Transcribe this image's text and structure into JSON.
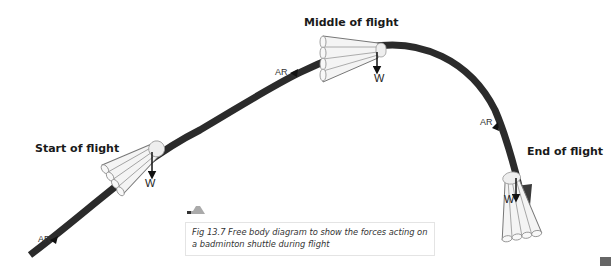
{
  "figure": {
    "stages": [
      {
        "label": "Start of flight",
        "weight_label": "W",
        "air_resistance_label": "AR"
      },
      {
        "label": "Middle of flight",
        "weight_label": "W",
        "air_resistance_label": "AR"
      },
      {
        "label": "End of flight",
        "weight_label": "W",
        "air_resistance_label": "AR"
      }
    ],
    "caption_line1": "Fig 13.7 Free body diagram to show the forces acting on",
    "caption_line2": "a badminton shuttle during flight"
  },
  "colors": {
    "trajectory": "#2b2b2b",
    "shuttle_fill": "#f4f4f4",
    "shuttle_stroke": "#666666",
    "caption_border": "#e4e4e4"
  }
}
